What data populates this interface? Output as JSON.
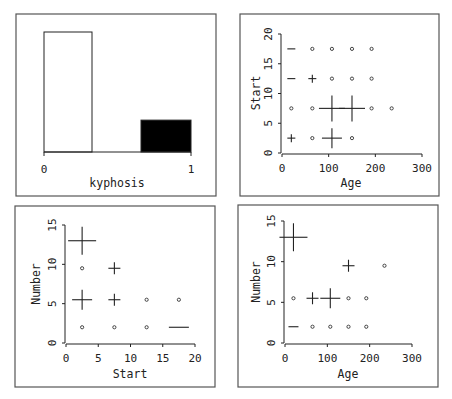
{
  "chart_data": [
    {
      "type": "bar",
      "title": "",
      "xlabel": "kyphosis",
      "ylabel": "",
      "categories": [
        "0",
        "1"
      ],
      "values": [
        64,
        17
      ],
      "bar_fills": [
        "#ffffff",
        "#000000"
      ],
      "xticks": [
        "0",
        "1"
      ],
      "grid": false
    },
    {
      "type": "scatter",
      "title": "",
      "xlabel": "Age",
      "ylabel": "Start",
      "xlim": [
        0,
        300
      ],
      "ylim": [
        0,
        20
      ],
      "xticks": [
        "0",
        "100",
        "200",
        "300"
      ],
      "yticks": [
        "0",
        "5",
        "10",
        "15",
        "20"
      ],
      "grid": false,
      "points": [
        {
          "x": 20,
          "y": 17.5,
          "glyph": "dash",
          "size": 4
        },
        {
          "x": 65,
          "y": 17.5,
          "glyph": "dot",
          "size": 1
        },
        {
          "x": 107,
          "y": 17.5,
          "glyph": "dot",
          "size": 1
        },
        {
          "x": 150,
          "y": 17.5,
          "glyph": "dot",
          "size": 1
        },
        {
          "x": 192,
          "y": 17.5,
          "glyph": "dot",
          "size": 1
        },
        {
          "x": 20,
          "y": 12.5,
          "glyph": "dash",
          "size": 4
        },
        {
          "x": 65,
          "y": 12.5,
          "glyph": "cross",
          "size": 4
        },
        {
          "x": 107,
          "y": 12.5,
          "glyph": "dot",
          "size": 1
        },
        {
          "x": 150,
          "y": 12.5,
          "glyph": "dot",
          "size": 1
        },
        {
          "x": 192,
          "y": 12.5,
          "glyph": "dot",
          "size": 1
        },
        {
          "x": 20,
          "y": 7.5,
          "glyph": "dot",
          "size": 1
        },
        {
          "x": 65,
          "y": 7.5,
          "glyph": "dot",
          "size": 1
        },
        {
          "x": 107,
          "y": 7.5,
          "glyph": "cross",
          "size": 13
        },
        {
          "x": 150,
          "y": 7.5,
          "glyph": "cross",
          "size": 13
        },
        {
          "x": 192,
          "y": 7.5,
          "glyph": "dot",
          "size": 1
        },
        {
          "x": 235,
          "y": 7.5,
          "glyph": "dot",
          "size": 1
        },
        {
          "x": 20,
          "y": 2.5,
          "glyph": "cross",
          "size": 4
        },
        {
          "x": 65,
          "y": 2.5,
          "glyph": "dot",
          "size": 1
        },
        {
          "x": 107,
          "y": 2.5,
          "glyph": "cross",
          "size": 10
        },
        {
          "x": 150,
          "y": 2.5,
          "glyph": "dot",
          "size": 1
        }
      ]
    },
    {
      "type": "scatter",
      "title": "",
      "xlabel": "Start",
      "ylabel": "Number",
      "xlim": [
        0,
        20
      ],
      "ylim": [
        0,
        15
      ],
      "xticks": [
        "0",
        "5",
        "10",
        "15",
        "20"
      ],
      "yticks": [
        "0",
        "5",
        "10",
        "15"
      ],
      "grid": false,
      "points": [
        {
          "x": 2.5,
          "y": 13,
          "glyph": "cross",
          "size": 14
        },
        {
          "x": 2.5,
          "y": 9.5,
          "glyph": "dot",
          "size": 1
        },
        {
          "x": 7.5,
          "y": 9.5,
          "glyph": "cross",
          "size": 6
        },
        {
          "x": 2.5,
          "y": 5.5,
          "glyph": "cross",
          "size": 10
        },
        {
          "x": 7.5,
          "y": 5.5,
          "glyph": "cross",
          "size": 6
        },
        {
          "x": 12.5,
          "y": 5.5,
          "glyph": "dot",
          "size": 1
        },
        {
          "x": 17.5,
          "y": 5.5,
          "glyph": "dot",
          "size": 1
        },
        {
          "x": 2.5,
          "y": 2,
          "glyph": "dot",
          "size": 1
        },
        {
          "x": 7.5,
          "y": 2,
          "glyph": "dot",
          "size": 1
        },
        {
          "x": 12.5,
          "y": 2,
          "glyph": "dot",
          "size": 1
        },
        {
          "x": 17.5,
          "y": 2,
          "glyph": "dash",
          "size": 10
        }
      ]
    },
    {
      "type": "scatter",
      "title": "",
      "xlabel": "Age",
      "ylabel": "Number",
      "xlim": [
        0,
        300
      ],
      "ylim": [
        0,
        15
      ],
      "xticks": [
        "0",
        "100",
        "200",
        "300"
      ],
      "yticks": [
        "0",
        "5",
        "10",
        "15"
      ],
      "grid": false,
      "points": [
        {
          "x": 20,
          "y": 13,
          "glyph": "cross",
          "size": 14
        },
        {
          "x": 150,
          "y": 9.5,
          "glyph": "cross",
          "size": 6
        },
        {
          "x": 235,
          "y": 9.5,
          "glyph": "dot",
          "size": 1
        },
        {
          "x": 20,
          "y": 5.5,
          "glyph": "dot",
          "size": 1
        },
        {
          "x": 65,
          "y": 5.5,
          "glyph": "cross",
          "size": 6
        },
        {
          "x": 107,
          "y": 5.5,
          "glyph": "cross",
          "size": 10
        },
        {
          "x": 150,
          "y": 5.5,
          "glyph": "dot",
          "size": 1
        },
        {
          "x": 192,
          "y": 5.5,
          "glyph": "dot",
          "size": 1
        },
        {
          "x": 20,
          "y": 2,
          "glyph": "dash",
          "size": 5
        },
        {
          "x": 65,
          "y": 2,
          "glyph": "dot",
          "size": 1
        },
        {
          "x": 107,
          "y": 2,
          "glyph": "dot",
          "size": 1
        },
        {
          "x": 150,
          "y": 2,
          "glyph": "dot",
          "size": 1
        },
        {
          "x": 192,
          "y": 2,
          "glyph": "dot",
          "size": 1
        }
      ]
    }
  ],
  "panels": [
    {
      "xlabel": "kyphosis",
      "xtick0": "0",
      "xtick1": "1"
    },
    {
      "xlabel": "Age",
      "ylabel": "Start"
    },
    {
      "xlabel": "Start",
      "ylabel": "Number"
    },
    {
      "xlabel": "Age",
      "ylabel": "Number"
    }
  ]
}
